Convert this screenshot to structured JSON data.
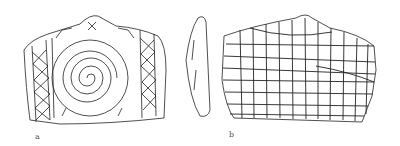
{
  "figure": {
    "labels": {
      "a": "a",
      "b": "b"
    },
    "items": [
      {
        "id": "a",
        "description": "plaque with central spiral, flanked by vertical bands of lozenge/cross-hatch pattern, chevrons at corners"
      },
      {
        "id": "side",
        "description": "side profile of plaque"
      },
      {
        "id": "b",
        "description": "plaque reverse with incised grid pattern"
      }
    ],
    "colors": {
      "ink": "#222222",
      "background": "#ffffff"
    }
  }
}
